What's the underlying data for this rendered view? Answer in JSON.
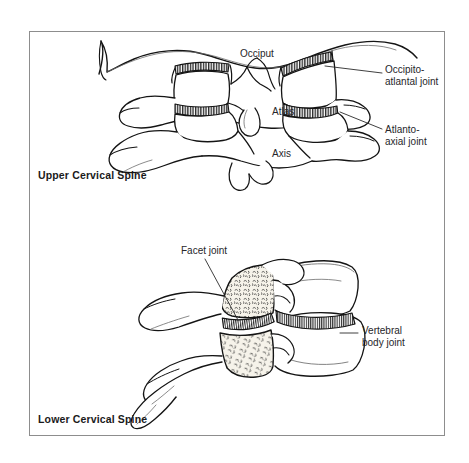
{
  "figure": {
    "background_color": "#ffffff",
    "frame_color": "#8d8d8d",
    "ink_color": "#1a1a1a",
    "cartilage_fill": "#3a3a3a",
    "bone_fill": "#ffffff",
    "trabecular_fill": "#f2efe6"
  },
  "sections": [
    {
      "id": "upper",
      "title": "Upper Cervical Spine"
    },
    {
      "id": "lower",
      "title": "Lower Cervical Spine"
    }
  ],
  "upper_panel": {
    "title": "Upper Cervical Spine",
    "internal_labels": [
      {
        "name": "occiput",
        "text": "Occiput"
      },
      {
        "name": "atlas",
        "text": "Atlas"
      },
      {
        "name": "axis",
        "text": "Axis"
      }
    ],
    "callouts": [
      {
        "name": "occipito-atlantal-joint",
        "line1": "Occipito-",
        "line2": "atlantal joint"
      },
      {
        "name": "atlanto-axial-joint",
        "line1": "Atlanto-",
        "line2": "axial joint"
      }
    ]
  },
  "lower_panel": {
    "title": "Lower Cervical Spine",
    "internal_labels": [
      {
        "name": "facet-joint",
        "text": "Facet joint"
      }
    ],
    "callouts": [
      {
        "name": "vertebral-body-joint",
        "line1": "Vertebral",
        "line2": "body joint"
      }
    ]
  }
}
